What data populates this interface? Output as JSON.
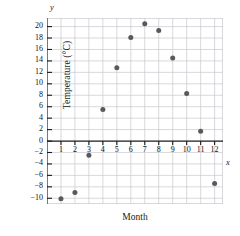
{
  "chart_data": {
    "type": "scatter",
    "title": "",
    "xlabel": "Month",
    "ylabel": "Temperature (°C)",
    "x_axis_letter": "x",
    "y_axis_letter": "y",
    "xlim": [
      0,
      12.6
    ],
    "ylim": [
      -11,
      21.5
    ],
    "grid": true,
    "legend": null,
    "x_ticks": [
      1,
      2,
      3,
      4,
      5,
      6,
      7,
      8,
      9,
      10,
      11,
      12
    ],
    "x_tick_labels": [
      "1",
      "2",
      "3",
      "4",
      "5",
      "6",
      "7",
      "8",
      "9",
      "10",
      "11",
      "12"
    ],
    "y_ticks": [
      -10,
      -8,
      -6,
      -4,
      -2,
      0,
      2,
      4,
      6,
      8,
      10,
      12,
      14,
      16,
      18,
      20
    ],
    "y_tick_labels": [
      "-10",
      "-8",
      "-6",
      "-4",
      "-2",
      "0",
      "2",
      "4",
      "6",
      "8",
      "10",
      "12",
      "14",
      "16",
      "18",
      "20"
    ],
    "x": [
      1,
      2,
      3,
      4,
      5,
      6,
      7,
      8,
      9,
      10,
      11,
      12
    ],
    "values": [
      -10.1,
      -9.0,
      -2.5,
      5.5,
      12.8,
      18.1,
      20.5,
      19.3,
      14.5,
      8.3,
      1.7,
      -7.4
    ],
    "point_color": "#595959",
    "grid_color": "#c9c9cf",
    "axis_color": "#1a1a1a",
    "point_radius_px": 2.5
  }
}
